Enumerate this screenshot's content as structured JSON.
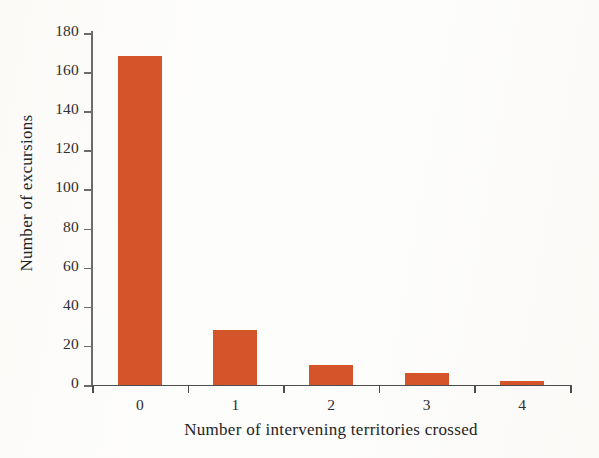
{
  "chart_data": {
    "type": "bar",
    "title": "",
    "xlabel": "Number of intervening territories crossed",
    "ylabel": "Number of excursions",
    "categories": [
      "0",
      "1",
      "2",
      "3",
      "4"
    ],
    "values": [
      168,
      28,
      10,
      6,
      2
    ],
    "ylim": [
      0,
      180
    ],
    "ytick_values": [
      0,
      20,
      40,
      60,
      80,
      100,
      120,
      140,
      160,
      180
    ],
    "ytick_labels": [
      "0",
      "20",
      "40",
      "60",
      "80",
      "100",
      "120",
      "140",
      "160",
      "180"
    ],
    "grid": false,
    "legend": null,
    "bar_color": "#d4552a",
    "axis_color": "#4d4d4d",
    "text_color": "#232323",
    "background_color": "#fdfdfc"
  }
}
